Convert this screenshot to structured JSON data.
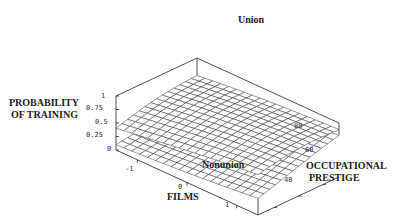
{
  "chart_data": {
    "type": "surface3d",
    "title": "",
    "xlabel": "FILMS",
    "ylabel": "OCCUPATIONAL PRESTIGE",
    "zlabel": "PROBABILITY OF TRAINING",
    "x_ticks": [
      "-1",
      "0",
      "1"
    ],
    "y_ticks": [
      "40",
      "60",
      "80"
    ],
    "z_ticks": [
      "0",
      "0.25",
      "0.5",
      "0.75",
      "1"
    ],
    "zlim": [
      0,
      1
    ],
    "annotations": [
      "Union",
      "Nonunion"
    ],
    "series": [
      {
        "name": "Union",
        "description": "upper surface, probability rises with films and prestige",
        "approx_range": [
          0.45,
          0.95
        ]
      },
      {
        "name": "Nonunion",
        "description": "lower surface, probability rises with prestige and films",
        "approx_range": [
          0.1,
          0.75
        ]
      }
    ],
    "grid": false
  },
  "labels": {
    "union": "Union",
    "nonunion": "Nonunion",
    "zlabel_line1": "PROBABILITY",
    "zlabel_line2": "OF TRAINING",
    "xlabel": "FILMS",
    "ylabel_line1": "OCCUPATIONAL",
    "ylabel_line2": "PRESTIGE"
  },
  "ticks": {
    "z": [
      "1",
      "0.75",
      "0.5",
      "0.25",
      "0"
    ],
    "x": [
      "-1",
      "0",
      "1"
    ],
    "y": [
      "80",
      "60",
      "40"
    ]
  }
}
